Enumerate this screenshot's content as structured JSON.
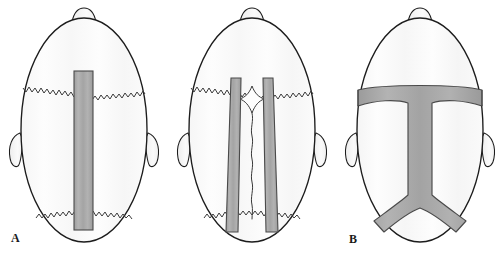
{
  "figure": {
    "type": "anatomical-diagram",
    "view": "vertex (top-down) view of infant skull",
    "panel_count": 3,
    "background_color": "#ffffff"
  },
  "style": {
    "outline_color": "#1c1c1c",
    "skull_fill": "#fbfbfb",
    "strip_fill": "#a9a9a9",
    "strip_edge": "#4a4a4a",
    "suture_color": "#3a3a3a",
    "label_color": "#1a1a1a"
  },
  "panels": [
    {
      "id": "A",
      "label": "A",
      "description": "Single midline sagittal strip craniectomy",
      "features": {
        "nose_bump": "nose-bump",
        "ears": [
          "left-ear",
          "right-ear"
        ],
        "coronal_suture": "zigzag coronal suture",
        "lambdoid_suture": "zigzag lambdoid suture",
        "strips": [
          "midline sagittal strip"
        ]
      }
    },
    {
      "id": "B",
      "label": "B",
      "description": "Paired parasagittal strips flanking sagittal suture with patent anterior fontanelle",
      "features": {
        "nose_bump": "nose-bump",
        "ears": [
          "left-ear",
          "right-ear"
        ],
        "coronal_suture": "zigzag coronal suture",
        "lambdoid_suture": "zigzag lambdoid suture",
        "fontanelle": "diamond-shaped anterior fontanelle",
        "sagittal_suture": "wavy midline sagittal suture",
        "strips": [
          "left parasagittal strip",
          "right parasagittal strip"
        ]
      }
    },
    {
      "id": "C",
      "label": "C",
      "description": "Anchor / T-shaped craniectomy: transverse coronal band with midline sagittal limb branching into lambdoid arms",
      "features": {
        "nose_bump": "nose-bump",
        "ears": [
          "left-ear",
          "right-ear"
        ],
        "strips": [
          "transverse coronal band",
          "midline sagittal limb",
          "left lambdoid arm",
          "right lambdoid arm"
        ]
      }
    }
  ],
  "labels": {
    "a": "A",
    "b": "B",
    "c": "C"
  }
}
